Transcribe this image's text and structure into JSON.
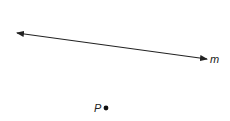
{
  "diagram": {
    "line": {
      "label": "m",
      "start": [
        17,
        33
      ],
      "end": [
        207,
        59
      ],
      "color": "#222222",
      "arrows": "both"
    },
    "point": {
      "label": "P",
      "position": [
        106,
        108
      ],
      "color": "#111111"
    }
  }
}
